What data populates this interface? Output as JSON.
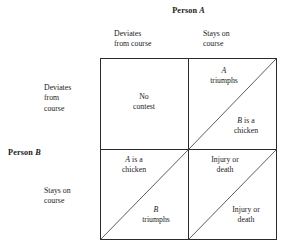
{
  "figure": {
    "kind": "payoff-matrix",
    "column_player": {
      "label_prefix": "Person",
      "label_var": "A"
    },
    "row_player": {
      "label_prefix": "Person",
      "label_var": "B"
    },
    "column_headers": [
      "Deviates\nfrom course",
      "Stays on\ncourse"
    ],
    "row_headers": [
      "Deviates\nfrom\ncourse",
      "Stays on\ncourse"
    ],
    "cells": [
      {
        "row": 0,
        "col": 0,
        "has_diagonal": false,
        "center": {
          "text": "No\ncontest"
        }
      },
      {
        "row": 0,
        "col": 1,
        "has_diagonal": true,
        "upper": {
          "var": "A",
          "text": "\ntriumphs"
        },
        "lower": {
          "var": "B",
          "text": " is a\nchicken"
        }
      },
      {
        "row": 1,
        "col": 0,
        "has_diagonal": true,
        "upper": {
          "var": "A",
          "text": " is a\nchicken"
        },
        "lower": {
          "var": "B",
          "text": "\ntriumphs"
        }
      },
      {
        "row": 1,
        "col": 1,
        "has_diagonal": true,
        "upper": {
          "text": "Injury or\ndeath"
        },
        "lower": {
          "text": "Injury or\ndeath"
        }
      }
    ],
    "colors": {
      "background": "#ffffff",
      "ink": "#1a1a1a",
      "rule": "#2b2b2b",
      "diagonal": "#4a4a4a"
    }
  }
}
